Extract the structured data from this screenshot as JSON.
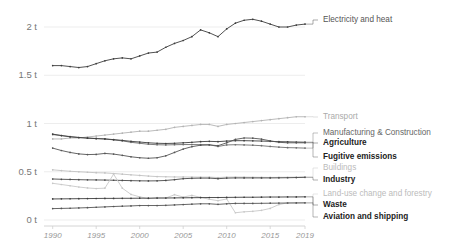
{
  "chart_data": {
    "type": "line",
    "title": "",
    "subtitle": "",
    "xlabel": "",
    "ylabel": "",
    "unit_suffix": " t",
    "grid": true,
    "legend_position": "right-inline",
    "xlim": [
      1989,
      2019
    ],
    "ylim": [
      0,
      2.2
    ],
    "x": [
      1990,
      1991,
      1992,
      1993,
      1994,
      1995,
      1996,
      1997,
      1998,
      1999,
      2000,
      2001,
      2002,
      2003,
      2004,
      2005,
      2006,
      2007,
      2008,
      2009,
      2010,
      2011,
      2012,
      2013,
      2014,
      2015,
      2016,
      2017,
      2018,
      2019
    ],
    "ytick_labels": [
      "0 t",
      "0.5 t",
      "1 t",
      "1.5 t",
      "2 t"
    ],
    "ytick_values": [
      0,
      0.5,
      1,
      1.5,
      2
    ],
    "xtick_labels": [
      "1990",
      "1995",
      "2000",
      "2005",
      "2010",
      "2015",
      "2019"
    ],
    "xtick_values": [
      1990,
      1995,
      2000,
      2005,
      2010,
      2015,
      2019
    ],
    "series": [
      {
        "name": "Electricity and heat",
        "label": "Electricity and heat",
        "color": "#3d3d3d",
        "legend_color": "#555555",
        "legend_weight": "normal",
        "legend_y": 20,
        "values": [
          1.6,
          1.6,
          1.59,
          1.58,
          1.59,
          1.62,
          1.65,
          1.67,
          1.68,
          1.67,
          1.7,
          1.73,
          1.74,
          1.79,
          1.83,
          1.86,
          1.9,
          1.97,
          1.94,
          1.9,
          1.98,
          2.04,
          2.07,
          2.08,
          2.06,
          2.03,
          2.0,
          2.0,
          2.02,
          2.03
        ]
      },
      {
        "name": "Transport",
        "label": "Transport",
        "color": "#b3b3b3",
        "legend_color": "#aaaaaa",
        "legend_weight": "normal",
        "legend_y": 117,
        "values": [
          0.84,
          0.84,
          0.85,
          0.85,
          0.86,
          0.87,
          0.88,
          0.89,
          0.9,
          0.91,
          0.92,
          0.92,
          0.93,
          0.94,
          0.96,
          0.97,
          0.98,
          0.99,
          0.99,
          0.97,
          0.99,
          1.0,
          1.01,
          1.02,
          1.03,
          1.04,
          1.05,
          1.06,
          1.07,
          1.07
        ]
      },
      {
        "name": "Manufacturing & Construction",
        "label": "Manufacturing & Construction",
        "color": "#6e6e6e",
        "legend_color": "#666666",
        "legend_weight": "normal",
        "legend_y": 133,
        "values": [
          0.885,
          0.875,
          0.865,
          0.855,
          0.85,
          0.845,
          0.84,
          0.83,
          0.82,
          0.805,
          0.795,
          0.785,
          0.78,
          0.778,
          0.78,
          0.782,
          0.782,
          0.781,
          0.78,
          0.762,
          0.778,
          0.78,
          0.778,
          0.775,
          0.77,
          0.762,
          0.755,
          0.75,
          0.748,
          0.745
        ]
      },
      {
        "name": "Agriculture",
        "label": "Agriculture",
        "color": "#3d3d3d",
        "legend_color": "#222222",
        "legend_weight": "bold",
        "legend_y": 143,
        "values": [
          0.89,
          0.875,
          0.862,
          0.855,
          0.848,
          0.843,
          0.84,
          0.833,
          0.825,
          0.815,
          0.808,
          0.8,
          0.795,
          0.793,
          0.795,
          0.8,
          0.805,
          0.812,
          0.815,
          0.812,
          0.818,
          0.822,
          0.822,
          0.82,
          0.818,
          0.815,
          0.812,
          0.81,
          0.808,
          0.806
        ]
      },
      {
        "name": "Fugitive emissions",
        "label": "Fugitive emissions",
        "color": "#555555",
        "legend_color": "#222222",
        "legend_weight": "bold",
        "legend_y": 157,
        "values": [
          0.745,
          0.72,
          0.7,
          0.685,
          0.678,
          0.68,
          0.69,
          0.683,
          0.67,
          0.655,
          0.645,
          0.64,
          0.645,
          0.665,
          0.7,
          0.735,
          0.76,
          0.775,
          0.778,
          0.77,
          0.8,
          0.835,
          0.85,
          0.848,
          0.838,
          0.82,
          0.805,
          0.8,
          0.8,
          0.8
        ]
      },
      {
        "name": "Buildings",
        "label": "Buildings",
        "color": "#c2c2c2",
        "legend_color": "#bbbbbb",
        "legend_weight": "normal",
        "legend_y": 168,
        "values": [
          0.52,
          0.512,
          0.505,
          0.5,
          0.495,
          0.49,
          0.488,
          0.482,
          0.475,
          0.468,
          0.462,
          0.455,
          0.45,
          0.448,
          0.446,
          0.446,
          0.445,
          0.444,
          0.444,
          0.44,
          0.444,
          0.445,
          0.444,
          0.443,
          0.442,
          0.441,
          0.442,
          0.443,
          0.444,
          0.446
        ]
      },
      {
        "name": "Industry",
        "label": "Industry",
        "color": "#4a4a4a",
        "legend_color": "#222222",
        "legend_weight": "bold",
        "legend_y": 180,
        "values": [
          0.425,
          0.422,
          0.42,
          0.418,
          0.416,
          0.415,
          0.414,
          0.412,
          0.41,
          0.408,
          0.406,
          0.405,
          0.406,
          0.41,
          0.418,
          0.428,
          0.432,
          0.434,
          0.434,
          0.428,
          0.434,
          0.436,
          0.436,
          0.436,
          0.436,
          0.436,
          0.437,
          0.438,
          0.44,
          0.442
        ]
      },
      {
        "name": "Land-use change and forestry",
        "label": "Land-use change and forestry",
        "color": "#c8c8c8",
        "legend_color": "#bbbbbb",
        "legend_weight": "normal",
        "legend_y": 194,
        "values": [
          0.38,
          0.368,
          0.355,
          0.342,
          0.332,
          0.326,
          0.33,
          0.475,
          0.33,
          0.265,
          0.24,
          0.222,
          0.232,
          0.228,
          0.262,
          0.238,
          0.255,
          0.235,
          0.215,
          0.2,
          0.218,
          0.075,
          0.085,
          0.09,
          0.1,
          0.12,
          0.16,
          0.178,
          0.176,
          0.175
        ]
      },
      {
        "name": "Waste",
        "label": "Waste",
        "color": "#3d3d3d",
        "legend_color": "#222222",
        "legend_weight": "bold",
        "legend_y": 205,
        "values": [
          0.218,
          0.219,
          0.22,
          0.221,
          0.222,
          0.223,
          0.224,
          0.224,
          0.225,
          0.225,
          0.226,
          0.226,
          0.227,
          0.228,
          0.229,
          0.23,
          0.231,
          0.232,
          0.233,
          0.233,
          0.234,
          0.235,
          0.236,
          0.236,
          0.237,
          0.238,
          0.238,
          0.239,
          0.239,
          0.24
        ]
      },
      {
        "name": "Aviation and shipping",
        "label": "Aviation and shipping",
        "color": "#555555",
        "legend_color": "#222222",
        "legend_weight": "bold",
        "legend_y": 217,
        "values": [
          0.118,
          0.12,
          0.122,
          0.125,
          0.128,
          0.132,
          0.136,
          0.14,
          0.143,
          0.146,
          0.15,
          0.15,
          0.15,
          0.152,
          0.156,
          0.16,
          0.164,
          0.168,
          0.168,
          0.162,
          0.168,
          0.172,
          0.172,
          0.172,
          0.173,
          0.174,
          0.175,
          0.176,
          0.177,
          0.178
        ]
      }
    ]
  },
  "axis": {
    "y_labels": [
      "2 t",
      "1.5 t",
      "1 t",
      "0.5 t",
      "0 t"
    ],
    "x_labels": [
      "1990",
      "1995",
      "2000",
      "2005",
      "2010",
      "2015",
      "2019"
    ]
  }
}
